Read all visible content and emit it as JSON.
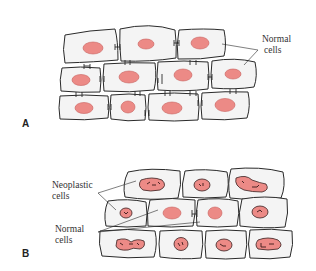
{
  "figure": {
    "panel_a": {
      "letter": "A",
      "label_normal_line1": "Normal",
      "label_normal_line2": "cells"
    },
    "panel_b": {
      "letter": "B",
      "label_neoplastic_line1": "Neoplastic",
      "label_neoplastic_line2": "cells",
      "label_normal_line1": "Normal",
      "label_normal_line2": "cells"
    }
  },
  "colors": {
    "nucleus": "#ec8a86",
    "cell_fill": "#f4f4f4",
    "outline": "#2a2a2a"
  }
}
